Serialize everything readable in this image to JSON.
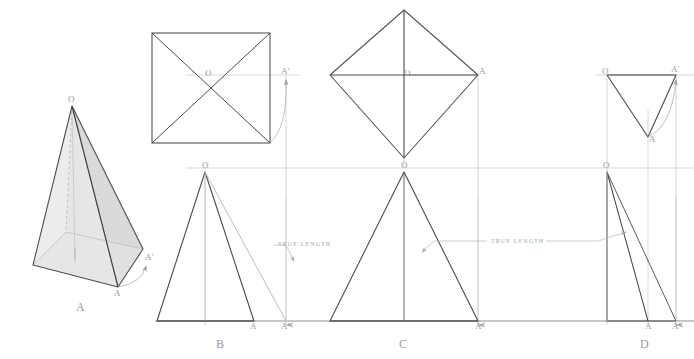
{
  "figure": {
    "colors": {
      "object_line": "#4a4a4a",
      "construction_line": "#b9b9b9",
      "projection_line": "#cccccc",
      "label_text": "#9a9a9a",
      "face_light": "#e2e2e2",
      "face_mid": "#d2d2d2",
      "face_dark": "#bdbdbd",
      "background": "#ffffff"
    }
  },
  "views": {
    "a": {
      "name": "A",
      "label": "A",
      "description": "pictorial view of square pyramid",
      "points": {
        "apex": "O",
        "corner": "A",
        "revolved_corner": "A'"
      },
      "point_labels": {
        "o": "O",
        "a": "A",
        "a_prime": "A'"
      }
    },
    "b": {
      "name": "B",
      "label": "B",
      "description": "top view square with diagonals and front view triangle",
      "point_labels": {
        "o_top": "O",
        "a_prime_top": "A'",
        "o_front": "O",
        "a_front": "A",
        "a_prime_front": "A'"
      }
    },
    "c": {
      "name": "C",
      "label": "C",
      "description": "top view diamond and front view isosceles triangle",
      "point_labels": {
        "o_top": "O",
        "a_top": "A",
        "o_front": "O",
        "a_front": "A"
      }
    },
    "d": {
      "name": "D",
      "label": "D",
      "description": "auxiliary top view right triangle and front view oblique triangle",
      "point_labels": {
        "o_top": "O",
        "a_top": "A",
        "a_prime_top": "A'",
        "o_front": "O",
        "a_front": "A",
        "a_prime_front": "A'"
      }
    }
  },
  "annotations": {
    "true_length_1": "TRUE LENGTH",
    "true_length_2": "TRUE LENGTH"
  }
}
